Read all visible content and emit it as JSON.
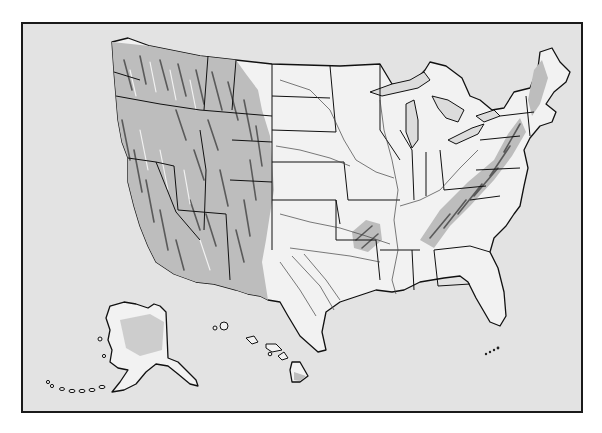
{
  "map": {
    "type": "shaded relief outline map",
    "subject": "United States",
    "labels": [],
    "regions": [
      {
        "name": "Contiguous United States",
        "relief": "Western mountains, Appalachians, Ozarks shaded"
      },
      {
        "name": "Alaska",
        "position": "lower-left inset"
      },
      {
        "name": "Hawaii",
        "position": "lower-center inset"
      }
    ],
    "colors": {
      "background": "#e3e3e3",
      "land": "#f2f2f2",
      "relief_shade": "#bdbdbd",
      "outline": "#111111",
      "frame": "#1a1a1a"
    }
  }
}
